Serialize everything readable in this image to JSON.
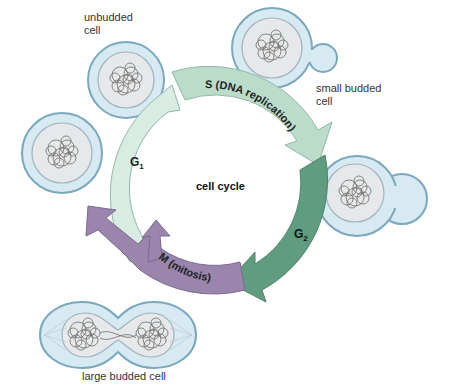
{
  "diagram": {
    "title": "cell cycle",
    "phases": [
      {
        "id": "G1",
        "label": "G",
        "subscript": "1",
        "color": "#d9ece4"
      },
      {
        "id": "S",
        "label": "S (DNA replication)",
        "color": "#bcdccb"
      },
      {
        "id": "G2",
        "label": "G",
        "subscript": "2",
        "color": "#5f9c80"
      },
      {
        "id": "M",
        "label": "M (mitosis)",
        "color": "#9a86ad"
      }
    ],
    "cells": [
      {
        "id": "unbudded",
        "label_line1": "unbudded",
        "label_line2": "cell"
      },
      {
        "id": "small-budded",
        "label_line1": "small budded",
        "label_line2": "cell"
      },
      {
        "id": "g2-budded",
        "label_line1": "",
        "label_line2": ""
      },
      {
        "id": "large-budded",
        "label_line1": "large budded cell",
        "label_line2": ""
      },
      {
        "id": "daughter",
        "label_line1": "",
        "label_line2": ""
      }
    ],
    "colors": {
      "cell_fill": "#d7e9f1",
      "cell_stroke": "#7aa8bd",
      "nucleus_fill": "#e6e8ea",
      "nucleus_stroke": "#9fb3bf",
      "dna": "#6b6b6b"
    }
  }
}
